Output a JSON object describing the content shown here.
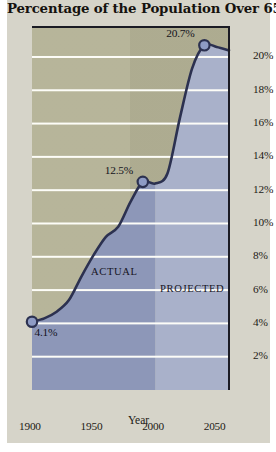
{
  "figure": {
    "title": "Percentage of the Population Over 65",
    "background_color": "#d6d4c9",
    "plot_background_color": "#b3b195"
  },
  "chart_data": {
    "type": "area",
    "title": "Percentage of the Population Over 65",
    "xlabel": "Year",
    "ylabel": "",
    "xlim": [
      1900,
      2060
    ],
    "ylim": [
      0,
      21.8
    ],
    "grid": true,
    "legend_position": "inline-annotations",
    "xticks": [
      1900,
      1950,
      2000,
      2050
    ],
    "xtick_labels": [
      "1900",
      "1950",
      "2000",
      "2050"
    ],
    "yticks": [
      2,
      4,
      6,
      8,
      10,
      12,
      14,
      16,
      18,
      20
    ],
    "ytick_labels": [
      "2%",
      "4%",
      "6%",
      "8%",
      "10%",
      "12%",
      "14%",
      "16%",
      "18%",
      "20%"
    ],
    "x": [
      1900,
      1910,
      1920,
      1930,
      1940,
      1950,
      1960,
      1970,
      1980,
      1990,
      2000,
      2010,
      2020,
      2030,
      2040,
      2050,
      2060
    ],
    "values": [
      4.1,
      4.3,
      4.7,
      5.4,
      6.8,
      8.1,
      9.2,
      9.8,
      11.3,
      12.5,
      12.4,
      13.0,
      16.3,
      19.3,
      20.7,
      20.6,
      20.4
    ],
    "series": [
      {
        "name": "Percentage of population over 65",
        "values": [
          4.1,
          4.3,
          4.7,
          5.4,
          6.8,
          8.1,
          9.2,
          9.8,
          11.3,
          12.5,
          12.4,
          13.0,
          16.3,
          19.3,
          20.7,
          20.6,
          20.4
        ],
        "line_color": "#2c3150",
        "marker_color": "#8e9bc4"
      }
    ],
    "regions": [
      {
        "label": "ACTUAL",
        "x_start": 1900,
        "x_end": 2000,
        "fill_color": "#8d97b8"
      },
      {
        "label": "PROJECTED",
        "x_start": 2000,
        "x_end": 2060,
        "fill_color": "#a9b1ca"
      }
    ],
    "annotations": [
      {
        "text": "4.1%",
        "x": 1900,
        "y": 4.1
      },
      {
        "text": "12.5%",
        "x": 1990,
        "y": 12.5
      },
      {
        "text": "20.7%",
        "x": 2040,
        "y": 20.7
      }
    ],
    "markers": [
      {
        "x": 1900,
        "y": 4.1
      },
      {
        "x": 1990,
        "y": 12.5
      },
      {
        "x": 2040,
        "y": 20.7
      }
    ]
  }
}
